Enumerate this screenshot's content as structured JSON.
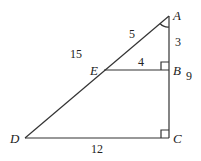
{
  "diagram": {
    "type": "geometry-similar-triangles",
    "points": {
      "A": {
        "label": "A",
        "x": 169,
        "y": 16
      },
      "B": {
        "label": "B",
        "x": 169,
        "y": 70
      },
      "C": {
        "label": "C",
        "x": 169,
        "y": 138
      },
      "D": {
        "label": "D",
        "x": 25,
        "y": 138
      },
      "E": {
        "label": "E",
        "x": 104,
        "y": 70
      }
    },
    "segments": [
      {
        "from": "A",
        "to": "D"
      },
      {
        "from": "A",
        "to": "C"
      },
      {
        "from": "D",
        "to": "C"
      },
      {
        "from": "E",
        "to": "B"
      }
    ],
    "lengths": {
      "AE": "5",
      "AB": "3",
      "AD": "15",
      "EB": "4",
      "AC": "9",
      "DC": "12"
    },
    "right_angles": [
      "B",
      "C"
    ],
    "angle_marks": [
      "A"
    ]
  }
}
